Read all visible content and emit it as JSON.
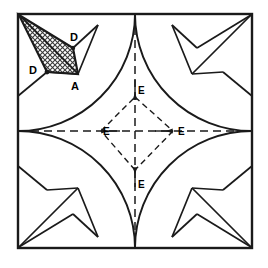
{
  "figure": {
    "name": "geometric-construction-square-with-corner-arcs",
    "type": "line-diagram",
    "background_color": "#ffffff",
    "stroke_color": "#1a1a1a",
    "hatch_color": "#333333"
  },
  "square": {
    "label": "outer-square",
    "x": 18,
    "y": 14,
    "side": 234,
    "corners": [
      [
        18,
        14
      ],
      [
        252,
        14
      ],
      [
        252,
        248
      ],
      [
        18,
        248
      ]
    ],
    "stroke_width": 2.2
  },
  "arcs": {
    "description": "quarter circles centered at each square corner, radius = half the side",
    "radius": 117,
    "centers": [
      [
        18,
        14
      ],
      [
        252,
        14
      ],
      [
        252,
        248
      ],
      [
        18,
        248
      ]
    ]
  },
  "midlines": {
    "vertical": {
      "x": 135,
      "y1": 14,
      "y2": 248,
      "style": "dashed"
    },
    "horizontal": {
      "y": 131,
      "x1": 18,
      "x2": 252,
      "style": "dashed"
    }
  },
  "center_points": {
    "label": "E",
    "count": 4,
    "points": [
      {
        "name": "E-top",
        "x": 135,
        "y": 97,
        "label_x": 140,
        "label_y": 92
      },
      {
        "name": "E-right",
        "x": 173,
        "y": 131,
        "label_x": 178,
        "label_y": 136
      },
      {
        "name": "E-bottom",
        "x": 135,
        "y": 170,
        "label_x": 140,
        "label_y": 184
      },
      {
        "name": "E-left",
        "x": 101,
        "y": 131,
        "label_x": 102,
        "label_y": 136
      }
    ]
  },
  "diamond": {
    "name": "dashed-rhombus-E-E-E-E",
    "style": "dashed",
    "vertices": [
      [
        135,
        97
      ],
      [
        173,
        131
      ],
      [
        135,
        170
      ],
      [
        101,
        131
      ]
    ]
  },
  "shaded_region": {
    "name": "hatched-quadrilateral",
    "fill": "crosshatch",
    "vertices": [
      [
        19,
        15
      ],
      [
        78,
        73
      ],
      [
        47,
        72
      ],
      [
        19,
        15
      ]
    ],
    "quad": [
      [
        19,
        15
      ],
      [
        72,
        49
      ],
      [
        78,
        74
      ],
      [
        47,
        72
      ]
    ]
  },
  "labels": [
    {
      "name": "label-D-upper",
      "text": "D",
      "x": 74,
      "y": 42
    },
    {
      "name": "label-D-left",
      "text": "D",
      "x": 32,
      "y": 72
    },
    {
      "name": "label-A",
      "text": "A",
      "x": 74,
      "y": 88
    },
    {
      "name": "label-E-top",
      "text": "E",
      "x": 139,
      "y": 92
    },
    {
      "name": "label-E-right",
      "text": "E",
      "x": 180,
      "y": 136
    },
    {
      "name": "label-E-left",
      "text": "E",
      "x": 101,
      "y": 136
    },
    {
      "name": "label-E-bottom",
      "text": "E",
      "x": 139,
      "y": 186
    }
  ],
  "corner_motifs": {
    "count": 4,
    "description": "pinwheel of straight chords inside each corner quarter region"
  }
}
